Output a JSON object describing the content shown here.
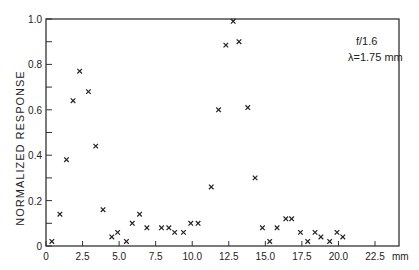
{
  "chart_data": {
    "type": "scatter",
    "title": "",
    "xlabel": "mm",
    "ylabel": "NORMALIZED RESPONSE",
    "xlim": [
      0,
      22.5
    ],
    "ylim": [
      0,
      1.0
    ],
    "grid": false,
    "marker": "x",
    "x_ticks": [
      0,
      2.5,
      5.0,
      7.5,
      10.0,
      12.5,
      15.0,
      17.5,
      20.0,
      22.5
    ],
    "x_tick_labels": [
      "0",
      "2.5",
      "5.0",
      "7.5",
      "10.0",
      "12.5",
      "15.0",
      "17.5",
      "20.0",
      "22.5"
    ],
    "y_ticks": [
      0,
      0.1,
      0.2,
      0.3,
      0.4,
      0.5,
      0.6,
      0.7,
      0.8,
      0.9,
      1.0
    ],
    "y_tick_labels": [
      "0",
      "",
      "0.2",
      "",
      "0.4",
      "",
      "0.6",
      "",
      "0.8",
      "",
      "1.0"
    ],
    "annotations": [
      "f/1.6",
      "λ=1.75 mm"
    ],
    "series": [
      {
        "name": "response",
        "x": [
          0.4,
          0.95,
          1.4,
          1.85,
          2.3,
          2.9,
          3.4,
          3.9,
          4.5,
          4.9,
          5.5,
          5.9,
          6.4,
          6.9,
          7.9,
          8.4,
          8.8,
          9.4,
          9.9,
          10.4,
          11.3,
          11.8,
          12.3,
          12.8,
          13.2,
          13.8,
          14.3,
          14.8,
          15.3,
          15.8,
          16.4,
          16.8,
          17.4,
          17.9,
          18.4,
          18.8,
          19.4,
          19.9,
          20.3
        ],
        "y": [
          0.02,
          0.14,
          0.38,
          0.64,
          0.77,
          0.68,
          0.44,
          0.16,
          0.04,
          0.06,
          0.02,
          0.1,
          0.14,
          0.08,
          0.08,
          0.08,
          0.06,
          0.06,
          0.1,
          0.1,
          0.26,
          0.6,
          0.885,
          0.99,
          0.9,
          0.61,
          0.3,
          0.08,
          0.02,
          0.08,
          0.12,
          0.12,
          0.06,
          0.02,
          0.06,
          0.04,
          0.02,
          0.06,
          0.04
        ]
      }
    ]
  }
}
